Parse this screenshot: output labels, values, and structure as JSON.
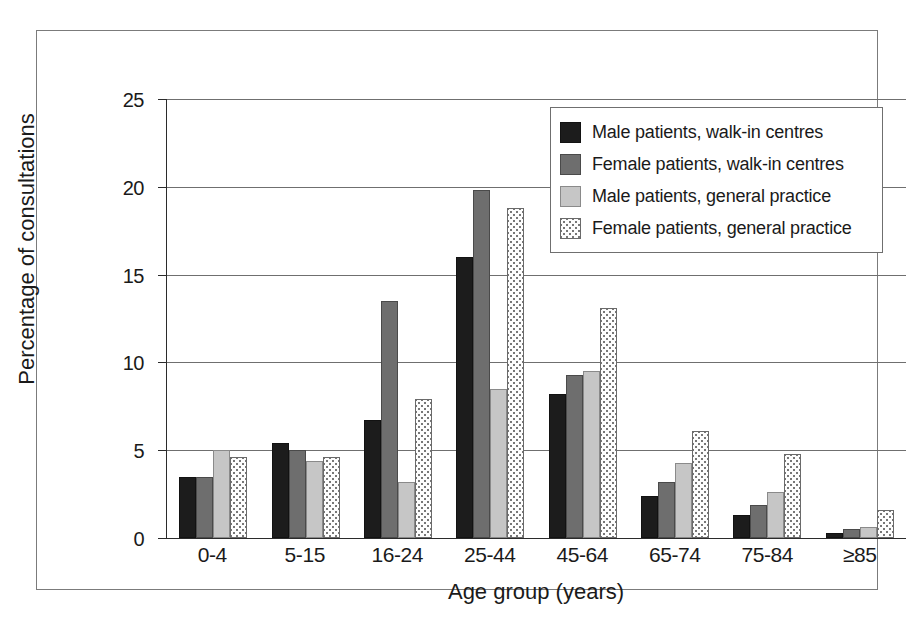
{
  "chart_data": {
    "type": "bar",
    "title": "",
    "xlabel": "Age group (years)",
    "ylabel": "Percentage of consultations",
    "categories": [
      "0-4",
      "5-15",
      "16-24",
      "25-44",
      "45-64",
      "65-74",
      "75-84",
      "≥85"
    ],
    "ylim": [
      0,
      25
    ],
    "yticks": [
      0,
      5,
      10,
      15,
      20,
      25
    ],
    "ytick_labels": [
      "0",
      "5",
      "10",
      "15",
      "20",
      "25"
    ],
    "grid": "horizontal",
    "legend_position": "top-right",
    "series": [
      {
        "name": "Male patients, walk-in centres",
        "color": "#1c1c1c",
        "pattern": "solid",
        "values": [
          3.5,
          5.4,
          6.7,
          16.0,
          8.2,
          2.4,
          1.3,
          0.3
        ]
      },
      {
        "name": "Female patients, walk-in centres",
        "color": "#6e6e6e",
        "pattern": "solid",
        "values": [
          3.5,
          5.0,
          13.5,
          19.8,
          9.3,
          3.2,
          1.9,
          0.5
        ]
      },
      {
        "name": "Male patients, general practice",
        "color": "#c6c6c6",
        "pattern": "solid",
        "values": [
          5.0,
          4.4,
          3.2,
          8.5,
          9.5,
          4.3,
          2.6,
          0.6
        ]
      },
      {
        "name": "Female patients, general practice",
        "color": "#fdfdfd",
        "pattern": "dotted",
        "values": [
          4.6,
          4.6,
          7.9,
          18.8,
          13.1,
          6.1,
          4.8,
          1.6
        ]
      }
    ]
  }
}
